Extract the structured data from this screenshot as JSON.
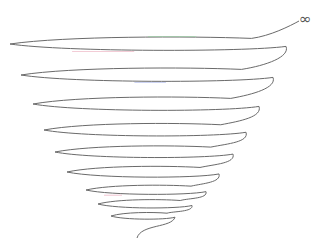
{
  "diagram": {
    "type": "conical-spiral",
    "symbol": "∞",
    "symbol_position": {
      "x": 299,
      "y": 12
    },
    "stroke_color": "#6a6a6a",
    "accent_colors": [
      "#e89ab0",
      "#8fd39a",
      "#9aa8e8"
    ],
    "loops": [
      {
        "cx": 148,
        "cy": 44,
        "rx": 138,
        "ry": 8
      },
      {
        "cx": 147,
        "cy": 75,
        "rx": 126,
        "ry": 8
      },
      {
        "cx": 146,
        "cy": 104,
        "rx": 113,
        "ry": 8
      },
      {
        "cx": 145,
        "cy": 130,
        "rx": 101,
        "ry": 7.5
      },
      {
        "cx": 144,
        "cy": 152,
        "rx": 89,
        "ry": 7
      },
      {
        "cx": 143,
        "cy": 172,
        "rx": 76,
        "ry": 6.5
      },
      {
        "cx": 146,
        "cy": 190,
        "rx": 60,
        "ry": 5.5
      },
      {
        "cx": 145,
        "cy": 204,
        "rx": 47,
        "ry": 5
      },
      {
        "cx": 143,
        "cy": 216,
        "rx": 32,
        "ry": 4
      }
    ],
    "tail_end": {
      "x": 137,
      "y": 238
    }
  }
}
